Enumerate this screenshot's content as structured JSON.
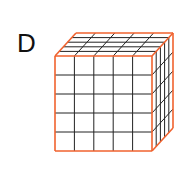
{
  "label": "D",
  "cube": {
    "grid": 5,
    "edge_color": "#f0622e",
    "grid_color": "#222222"
  }
}
